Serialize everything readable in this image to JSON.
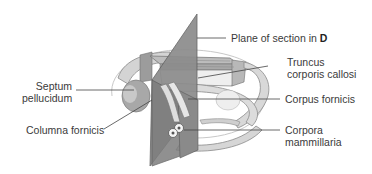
{
  "figure": {
    "labels": {
      "plane": {
        "text": "Plane of section in ",
        "bold": "D"
      },
      "truncus": {
        "line1": "Truncus",
        "line2": "corporis callosi"
      },
      "septum": {
        "line1": "Septum",
        "line2": "pellucidum"
      },
      "corpus_fornicis": {
        "text": "Corpus fornicis"
      },
      "columna": {
        "text": "Columna fornicis"
      },
      "corpora": {
        "line1": "Corpora",
        "line2": "mammillaria"
      }
    },
    "colors": {
      "background": "#ffffff",
      "plane": "#8a8a8a",
      "plane_dark": "#6e6e6e",
      "structure_light": "#e6e6e6",
      "structure_mid": "#c4c4c4",
      "structure_dark": "#9a9a9a",
      "leader": "#444444",
      "text": "#3a3a3a"
    }
  }
}
